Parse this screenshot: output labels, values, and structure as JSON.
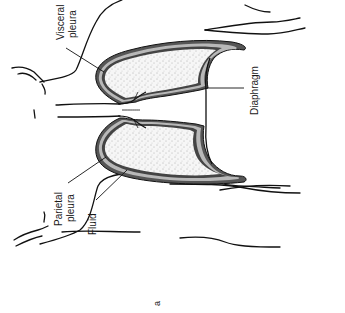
{
  "figure": {
    "panel_letter": "a",
    "colors": {
      "outline": "#111111",
      "parietal_pleura": "#555555",
      "pleural_fluid": "#b8b8b8",
      "visceral_pleura": "#444444",
      "lung_fill": "#f4f4f4",
      "stipple": "#6a6a6a",
      "background": "#ffffff"
    }
  },
  "labels": {
    "visceral_pleura_line1": "Visceral",
    "visceral_pleura_line2": "pleura",
    "diaphragm": "Diaphragm",
    "parietal_pleura_line1": "Parietal",
    "parietal_pleura_line2": "pleura",
    "fluid": "Fluid",
    "panel": "a"
  }
}
